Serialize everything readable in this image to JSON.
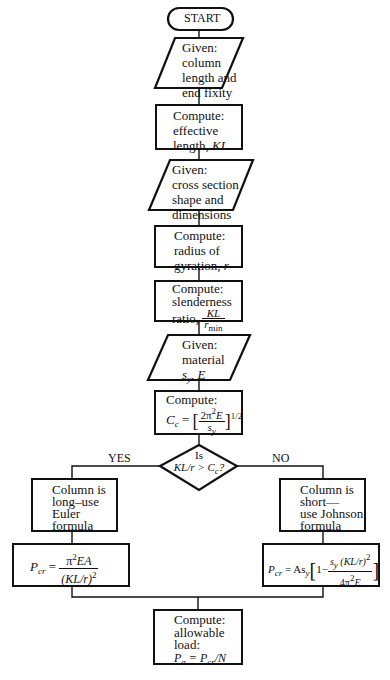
{
  "flowchart": {
    "start": "START",
    "steps": [
      {
        "id": "given-length",
        "shape": "parallelogram",
        "lines": [
          "Given:",
          "column",
          "length and",
          "end fixity"
        ]
      },
      {
        "id": "compute-kl",
        "shape": "process",
        "lines": [
          "Compute:",
          "effective",
          "length, "
        ],
        "var": "KL"
      },
      {
        "id": "given-section",
        "shape": "parallelogram",
        "lines": [
          "Given:",
          "cross section",
          "shape and",
          "dimensions"
        ]
      },
      {
        "id": "compute-r",
        "shape": "process",
        "lines": [
          "Compute:",
          "radius of",
          "gyration, "
        ],
        "var": "r"
      },
      {
        "id": "compute-slenderness",
        "shape": "process",
        "lines": [
          "Compute:",
          "slenderness",
          "ratio, "
        ],
        "frac_num": "KL",
        "frac_den": "r",
        "frac_den_sub": "min"
      },
      {
        "id": "given-material",
        "shape": "parallelogram",
        "lines": [
          "Given:",
          "material"
        ],
        "vars": "s",
        "vars_sub": "y",
        "vars_rest": ", E"
      },
      {
        "id": "compute-cc",
        "shape": "process",
        "lines": [
          "Compute:"
        ],
        "formula": {
          "lhs": "C",
          "lhs_sub": "c",
          "eq": "=",
          "num": "2π",
          "num_sup": "2",
          "num_rest": "E",
          "den": "s",
          "den_sub": "y",
          "exp": "1/2"
        }
      }
    ],
    "decision": {
      "line1": "Is",
      "line2": "KL/r > C",
      "line2_sub": "c",
      "line2_end": "?"
    },
    "yes_label": "YES",
    "no_label": "NO",
    "yes_branch": {
      "text": [
        "Column is",
        "long–use",
        "Euler",
        "formula"
      ],
      "formula": {
        "lhs": "P",
        "lhs_sub": "cr",
        "eq": "=",
        "num": "π",
        "num_sup": "2",
        "num_rest": "EA",
        "den": "(KL/r)",
        "den_sup": "2"
      }
    },
    "no_branch": {
      "text": [
        "Column is",
        "short—",
        "use Johnson",
        "formula"
      ],
      "formula": {
        "lhs": "P",
        "lhs_sub": "cr",
        "eq": "= As",
        "eq_sub": "y",
        "one": "1−",
        "num": "s",
        "num_sub": "y",
        "num_rest": " (KL/r)",
        "num_sup": "2",
        "den": "4π",
        "den_sup": "2",
        "den_rest": "E"
      }
    },
    "final": {
      "lines": [
        "Compute:",
        "allowable",
        "load:"
      ],
      "formula_p": "P",
      "formula_sub": "a",
      "formula_eq": " = P",
      "formula_sub2": "cr",
      "formula_end": "/N"
    }
  }
}
